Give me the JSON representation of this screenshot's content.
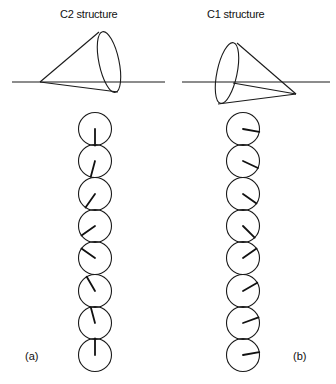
{
  "panels": [
    {
      "id": "a",
      "title": "C2 structure",
      "label": "(a)",
      "cone": {
        "axis_line": {
          "x1": 12,
          "y1": 82,
          "x2": 165,
          "y2": 82
        },
        "apex": [
          40,
          82
        ],
        "base_center": [
          109,
          62
        ],
        "base_rx": 10,
        "base_ry": 31,
        "base_rotate": -12,
        "edge_top": [
          99,
          32
        ],
        "edge_bottom": [
          118,
          92
        ]
      },
      "column_x": 95,
      "radius": 16.5,
      "circles": [
        {
          "cy": 129,
          "angle_deg": 90
        },
        {
          "cy": 161,
          "angle_deg": 105
        },
        {
          "cy": 194,
          "angle_deg": 125
        },
        {
          "cy": 226,
          "angle_deg": 145
        },
        {
          "cy": 258,
          "angle_deg": 215
        },
        {
          "cy": 291,
          "angle_deg": 240
        },
        {
          "cy": 323,
          "angle_deg": 255
        },
        {
          "cy": 355,
          "angle_deg": 270
        }
      ]
    },
    {
      "id": "b",
      "title": "C1 structure",
      "label": "(b)",
      "cone": {
        "axis_line": {
          "x1": 182,
          "y1": 82,
          "x2": 330,
          "y2": 82
        },
        "apex": [
          296,
          94
        ],
        "base_center": [
          227,
          73
        ],
        "base_rx": 10,
        "base_ry": 31,
        "base_rotate": 12,
        "edge_top": [
          237,
          43
        ],
        "edge_bottom": [
          218,
          104
        ],
        "inner_point": [
          233,
          83
        ]
      },
      "column_x": 243,
      "radius": 16.5,
      "circles": [
        {
          "cy": 129,
          "angle_deg": 10
        },
        {
          "cy": 161,
          "angle_deg": 25
        },
        {
          "cy": 194,
          "angle_deg": 35
        },
        {
          "cy": 226,
          "angle_deg": 45
        },
        {
          "cy": 258,
          "angle_deg": -35
        },
        {
          "cy": 291,
          "angle_deg": -30
        },
        {
          "cy": 323,
          "angle_deg": -20
        },
        {
          "cy": 355,
          "angle_deg": -10
        }
      ]
    }
  ]
}
